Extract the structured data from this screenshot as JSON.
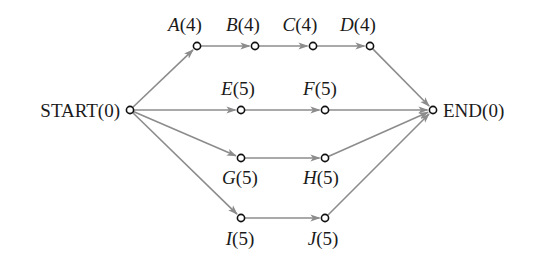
{
  "diagram": {
    "type": "activity-network",
    "colors": {
      "edge": "#8c8c8c",
      "node_stroke": "#111111",
      "node_fill": "#ffffff",
      "text": "#1a1a1a"
    },
    "nodes": [
      {
        "id": "START",
        "letter": "START",
        "duration": "(0)",
        "x": 130,
        "y": 110,
        "label_x": 120,
        "label_y": 117,
        "anchor": "end",
        "italic": false
      },
      {
        "id": "A",
        "letter": "A",
        "duration": "(4)",
        "x": 197,
        "y": 46,
        "label_x": 185,
        "label_y": 31,
        "anchor": "middle",
        "italic": true
      },
      {
        "id": "B",
        "letter": "B",
        "duration": "(4)",
        "x": 255,
        "y": 46,
        "label_x": 243,
        "label_y": 31,
        "anchor": "middle",
        "italic": true
      },
      {
        "id": "C",
        "letter": "C",
        "duration": "(4)",
        "x": 313,
        "y": 46,
        "label_x": 300,
        "label_y": 31,
        "anchor": "middle",
        "italic": true
      },
      {
        "id": "D",
        "letter": "D",
        "duration": "(4)",
        "x": 370,
        "y": 46,
        "label_x": 358,
        "label_y": 31,
        "anchor": "middle",
        "italic": true
      },
      {
        "id": "E",
        "letter": "E",
        "duration": "(5)",
        "x": 241,
        "y": 110,
        "label_x": 238,
        "label_y": 95,
        "anchor": "middle",
        "italic": true
      },
      {
        "id": "F",
        "letter": "F",
        "duration": "(5)",
        "x": 325,
        "y": 110,
        "label_x": 320,
        "label_y": 95,
        "anchor": "middle",
        "italic": true
      },
      {
        "id": "G",
        "letter": "G",
        "duration": "(5)",
        "x": 241,
        "y": 158,
        "label_x": 240,
        "label_y": 184,
        "anchor": "middle",
        "italic": true
      },
      {
        "id": "H",
        "letter": "H",
        "duration": "(5)",
        "x": 325,
        "y": 158,
        "label_x": 321,
        "label_y": 184,
        "anchor": "middle",
        "italic": true
      },
      {
        "id": "I",
        "letter": "I",
        "duration": "(5)",
        "x": 241,
        "y": 218,
        "label_x": 240,
        "label_y": 245,
        "anchor": "middle",
        "italic": true
      },
      {
        "id": "J",
        "letter": "J",
        "duration": "(5)",
        "x": 325,
        "y": 218,
        "label_x": 323,
        "label_y": 245,
        "anchor": "middle",
        "italic": true
      },
      {
        "id": "END",
        "letter": "END",
        "duration": "(0)",
        "x": 433,
        "y": 110,
        "label_x": 443,
        "label_y": 117,
        "anchor": "start",
        "italic": false
      }
    ],
    "edges": [
      {
        "from": "START",
        "to": "A"
      },
      {
        "from": "START",
        "to": "E"
      },
      {
        "from": "START",
        "to": "G"
      },
      {
        "from": "START",
        "to": "I"
      },
      {
        "from": "A",
        "to": "B"
      },
      {
        "from": "B",
        "to": "C"
      },
      {
        "from": "C",
        "to": "D"
      },
      {
        "from": "D",
        "to": "END"
      },
      {
        "from": "E",
        "to": "F"
      },
      {
        "from": "F",
        "to": "END"
      },
      {
        "from": "G",
        "to": "H"
      },
      {
        "from": "H",
        "to": "END"
      },
      {
        "from": "I",
        "to": "J"
      },
      {
        "from": "J",
        "to": "END"
      }
    ]
  }
}
